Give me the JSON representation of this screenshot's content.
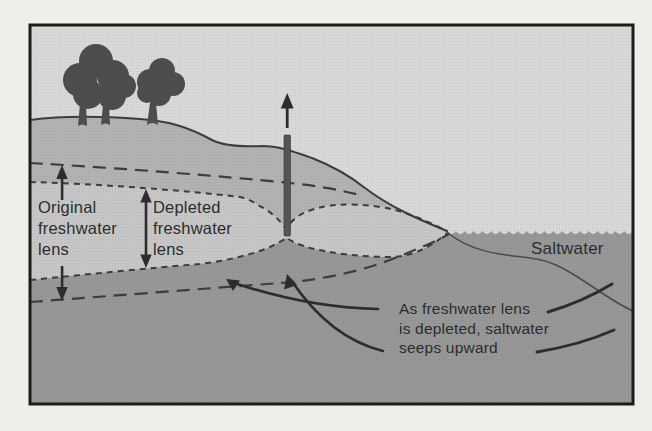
{
  "figure": {
    "type": "hydrogeology-cross-section",
    "labels": {
      "original_lens": "Original\nfreshwater\nlens",
      "depleted_lens": "Depleted\nfreshwater\nlens",
      "saltwater": "Saltwater",
      "seepage_note": "As freshwater lens\nis depleted, saltwater\nseeps upward"
    },
    "icons": {
      "trees": "tree-icon",
      "well": "well-icon",
      "well_flow": "up-arrow-icon",
      "extent_markers": "double-arrow-icon",
      "seepage": "curved-arrow-icon"
    },
    "colors": {
      "page": "#f0eee8",
      "sky": "#d8d8d8",
      "unsaturated_ground": "#b2b2b2",
      "freshwater_lens": "#c6c6c6",
      "saltwater_zone": "#979797",
      "ink": "#2d2d2d",
      "line": "#3d3d3d",
      "tree": "#4d4d4d",
      "well": "#555555",
      "frame": "#1c1c1c"
    }
  }
}
